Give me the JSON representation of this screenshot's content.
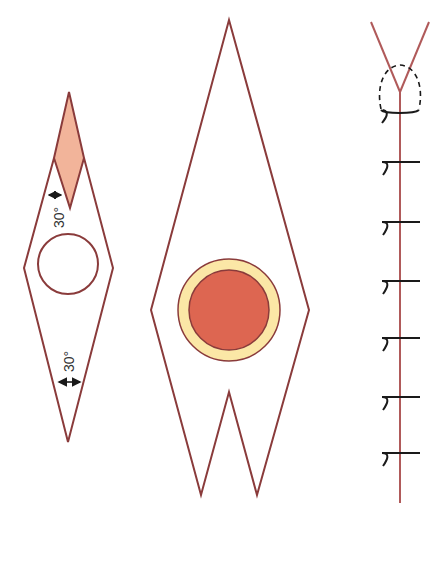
{
  "diagram": {
    "colors": {
      "outline": "#8a3b3b",
      "flap_fill": "#f2b49a",
      "ring_fill": "#fbe7a6",
      "core_fill": "#dd6651",
      "stitch": "#1a1a1a",
      "dashed": "#1a1a1a"
    },
    "left_shape": {
      "angle_label_top": "30°",
      "angle_label_bottom": "30°"
    },
    "middle_shape": {},
    "right_shape": {
      "stitch_count": 7
    }
  }
}
